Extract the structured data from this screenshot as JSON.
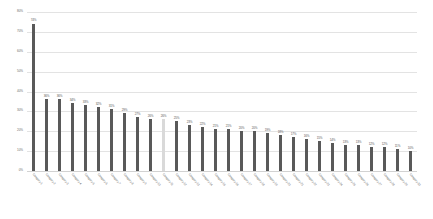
{
  "chart_data": {
    "type": "bar",
    "title": "",
    "subtitle": "",
    "xlabel": "",
    "ylabel": "",
    "ylim": [
      0,
      80
    ],
    "grid": true,
    "legend": "none",
    "y_ticks": [
      "80%",
      "70%",
      "60%",
      "50%",
      "40%",
      "30%",
      "20%",
      "10%",
      "0%"
    ],
    "y_tick_values": [
      80,
      70,
      60,
      50,
      40,
      30,
      20,
      10,
      0
    ],
    "highlight_index": 10,
    "highlight_color": "#d9d9d9",
    "bar_color": "#595959",
    "value_label_suffix": "%",
    "categories": [
      "Category 1",
      "Category 2",
      "Category 3",
      "Category 4",
      "Category 5",
      "Category 6",
      "Category 7",
      "Category 8",
      "Category 9",
      "Category 10",
      "Category 11",
      "Category 12",
      "Category 13",
      "Category 14",
      "Category 15",
      "Category 16",
      "Category 17",
      "Category 18",
      "Category 19",
      "Category 20",
      "Category 21",
      "Category 22",
      "Category 23",
      "Category 24",
      "Category 25",
      "Category 26",
      "Category 27",
      "Category 28",
      "Category 29",
      "Category 30"
    ],
    "values": [
      74,
      36,
      36,
      34,
      33,
      32,
      31,
      29,
      27,
      26,
      26,
      25,
      23,
      22,
      21,
      21,
      20,
      20,
      19,
      18,
      17,
      16,
      15,
      14,
      13,
      13,
      12,
      12,
      11,
      10
    ],
    "labels": [
      "74%",
      "36%",
      "36%",
      "34%",
      "33%",
      "32%",
      "31%",
      "29%",
      "27%",
      "26%",
      "26%",
      "25%",
      "23%",
      "22%",
      "21%",
      "21%",
      "20%",
      "20%",
      "19%",
      "18%",
      "17%",
      "16%",
      "15%",
      "14%",
      "13%",
      "13%",
      "12%",
      "12%",
      "11%",
      "10%"
    ]
  }
}
